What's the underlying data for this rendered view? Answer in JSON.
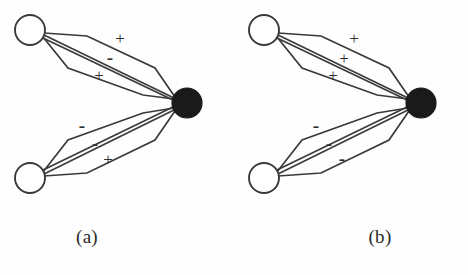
{
  "figure": {
    "background_color": "#fefefe",
    "stroke_color": "#3a3a3a",
    "filled_node_color": "#1a1a1a",
    "open_node_fill": "#ffffff"
  },
  "panels": [
    {
      "id": "a",
      "caption": "(a)",
      "nodes": [
        {
          "name": "upper-source-node",
          "type": "open-circle",
          "cx": 30,
          "cy": 30,
          "r": 15
        },
        {
          "name": "lower-source-node",
          "type": "open-circle",
          "cx": 30,
          "cy": 178,
          "r": 15
        },
        {
          "name": "target-node",
          "type": "filled-circle",
          "cx": 187,
          "cy": 103,
          "r": 15
        }
      ],
      "bundles": [
        {
          "name": "upper-bundle",
          "from": "upper-source-node",
          "to": "target-node",
          "edges": [
            {
              "name": "upper-edge-outer-top",
              "sign": "+",
              "label_x": 120,
              "label_y": 40
            },
            {
              "name": "upper-edge-middle",
              "sign": "-",
              "label_x": 110,
              "label_y": 60
            },
            {
              "name": "upper-edge-outer-bottom",
              "sign": "+",
              "label_x": 99,
              "label_y": 77
            }
          ]
        },
        {
          "name": "lower-bundle",
          "from": "lower-source-node",
          "to": "target-node",
          "edges": [
            {
              "name": "lower-edge-outer-top",
              "sign": "-",
              "label_x": 82,
              "label_y": 128
            },
            {
              "name": "lower-edge-middle",
              "sign": "-",
              "label_x": 95,
              "label_y": 146
            },
            {
              "name": "lower-edge-outer-bottom",
              "sign": "+",
              "label_x": 108,
              "label_y": 161
            }
          ]
        }
      ]
    },
    {
      "id": "b",
      "caption": "(b)",
      "nodes": [
        {
          "name": "upper-source-node",
          "type": "open-circle",
          "cx": 30,
          "cy": 30,
          "r": 15
        },
        {
          "name": "lower-source-node",
          "type": "open-circle",
          "cx": 30,
          "cy": 178,
          "r": 15
        },
        {
          "name": "target-node",
          "type": "filled-circle",
          "cx": 187,
          "cy": 103,
          "r": 15
        }
      ],
      "bundles": [
        {
          "name": "upper-bundle",
          "from": "upper-source-node",
          "to": "target-node",
          "edges": [
            {
              "name": "upper-edge-outer-top",
              "sign": "+",
              "label_x": 120,
              "label_y": 40
            },
            {
              "name": "upper-edge-middle",
              "sign": "+",
              "label_x": 110,
              "label_y": 60
            },
            {
              "name": "upper-edge-outer-bottom",
              "sign": "+",
              "label_x": 99,
              "label_y": 77
            }
          ]
        },
        {
          "name": "lower-bundle",
          "from": "lower-source-node",
          "to": "target-node",
          "edges": [
            {
              "name": "lower-edge-outer-top",
              "sign": "-",
              "label_x": 82,
              "label_y": 128
            },
            {
              "name": "lower-edge-middle",
              "sign": "-",
              "label_x": 95,
              "label_y": 146
            },
            {
              "name": "lower-edge-outer-bottom",
              "sign": "-",
              "label_x": 108,
              "label_y": 161
            }
          ]
        }
      ]
    }
  ]
}
